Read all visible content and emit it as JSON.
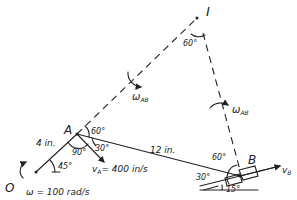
{
  "diagram": {
    "points": {
      "O": "O",
      "A": "A",
      "B": "B",
      "I": "I"
    },
    "labels": {
      "length_OA": "4 in.",
      "length_AB": "12 in.",
      "angle_O": "45°",
      "angle_A_90": "90°",
      "angle_A_30": "30°",
      "angle_A_60": "60°",
      "angle_I": "60°",
      "angle_B_60": "60°",
      "angle_B_30": "30°",
      "angle_slope": "15°",
      "omega": "ω = 100 rad/s",
      "vA": "v",
      "vA_sub": "A",
      "vA_value": "= 400 in/s",
      "vB": "v",
      "vB_sub": "B",
      "omegaAB_1": "ω",
      "omegaAB_1_sub": "AB",
      "omegaAB_2": "ω",
      "omegaAB_2_sub": "AB"
    }
  }
}
